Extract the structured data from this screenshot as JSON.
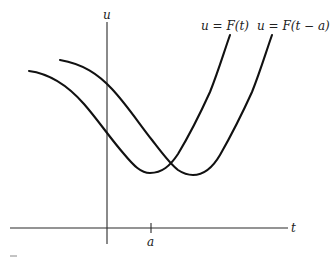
{
  "figure": {
    "axes": {
      "vertical_label": "u",
      "horizontal_label": "t",
      "tick_label": "a"
    },
    "curves": [
      {
        "name": "original",
        "label": "u = F(t)",
        "color": "#111111"
      },
      {
        "name": "shifted",
        "label": "u = F(t − a)",
        "color": "#111111"
      }
    ]
  }
}
